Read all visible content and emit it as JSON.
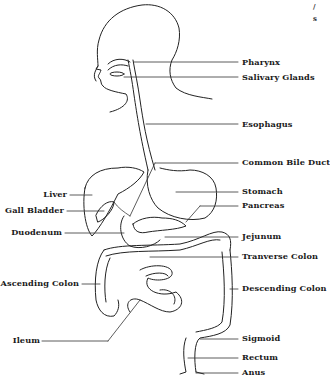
{
  "diagram": {
    "corner_fragments": [
      "/",
      "s"
    ],
    "labels_right": [
      {
        "id": "pharynx",
        "text": "Pharynx",
        "y": 62
      },
      {
        "id": "salivary-glands",
        "text": "Salivary Glands",
        "y": 77
      },
      {
        "id": "esophagus",
        "text": "Esophagus",
        "y": 124
      },
      {
        "id": "common-bile-duct",
        "text": "Common Bile Duct",
        "y": 162
      },
      {
        "id": "stomach",
        "text": "Stomach",
        "y": 191
      },
      {
        "id": "pancreas",
        "text": "Pancreas",
        "y": 205
      },
      {
        "id": "jejunum",
        "text": "Jejunum",
        "y": 236
      },
      {
        "id": "tranverse-colon",
        "text": "Tranverse Colon",
        "y": 256
      },
      {
        "id": "descending-colon",
        "text": "Descending Colon",
        "y": 288
      },
      {
        "id": "sigmoid",
        "text": "Sigmoid",
        "y": 338
      },
      {
        "id": "rectum",
        "text": "Rectum",
        "y": 357
      },
      {
        "id": "anus",
        "text": "Anus",
        "y": 372
      }
    ],
    "labels_left": [
      {
        "id": "liver",
        "text": "Liver",
        "y": 194
      },
      {
        "id": "gall-bladder",
        "text": "Gall Bladder",
        "y": 210
      },
      {
        "id": "duodenum",
        "text": "Duodenum",
        "y": 232
      },
      {
        "id": "ascending-colon",
        "text": "Ascending Colon",
        "y": 283
      },
      {
        "id": "ileum",
        "text": "Ileum",
        "y": 340
      }
    ]
  }
}
